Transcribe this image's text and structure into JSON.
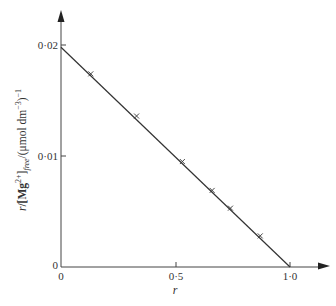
{
  "chart_data": {
    "type": "scatter",
    "title": "",
    "xlabel": "r",
    "ylabel": "r/[Mg2+]free/(μmol dm−3)−1",
    "xlim": [
      0,
      1.0
    ],
    "ylim": [
      0,
      0.02
    ],
    "x_ticks": [
      "0",
      "0·5",
      "1·0"
    ],
    "y_ticks": [
      "0",
      "0·01",
      "0·02"
    ],
    "grid": false,
    "legend": null,
    "series": [
      {
        "name": "measured",
        "marker": "x",
        "x": [
          0.13,
          0.33,
          0.53,
          0.66,
          0.74,
          0.87
        ],
        "y": [
          0.0174,
          0.0136,
          0.0095,
          0.0069,
          0.0053,
          0.0028
        ]
      },
      {
        "name": "fitted line",
        "style": "line",
        "x": [
          0.0,
          1.0
        ],
        "y": [
          0.0198,
          0.0
        ]
      }
    ]
  },
  "labels": {
    "x_title": "r",
    "y_title_r": "r",
    "y_title_bracket_open": "/[Mg",
    "y_title_charge": "2+",
    "y_title_bracket_close": "]",
    "y_title_sub": "free",
    "y_title_units": "/(μmol dm",
    "y_title_units_exp": "−3",
    "y_title_units_close": ")",
    "y_title_outer_exp": "−1",
    "tick_x0": "0",
    "tick_x05": "0·5",
    "tick_x1": "1·0",
    "tick_y0": "0",
    "tick_y001": "0·01",
    "tick_y002": "0·02"
  }
}
